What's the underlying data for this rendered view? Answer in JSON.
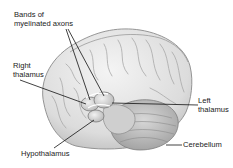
{
  "figure": {
    "labels": [
      {
        "id": "bands",
        "text": "Bands of\nmyelinated axons"
      },
      {
        "id": "right_thalamus",
        "text": "Right\nthalamus"
      },
      {
        "id": "left_thalamus",
        "text": "Left\nthalamus"
      },
      {
        "id": "hypothalamus",
        "text": "Hypothalamus"
      },
      {
        "id": "cerebellum",
        "text": "Cerebellum"
      }
    ]
  },
  "colors": {
    "background": "#ffffff",
    "brain_fill": "#e6e6e6",
    "brain_shadow": "#bdbdbd",
    "outline": "#8a8a8a",
    "leader_line": "#111111",
    "text": "#222222"
  }
}
